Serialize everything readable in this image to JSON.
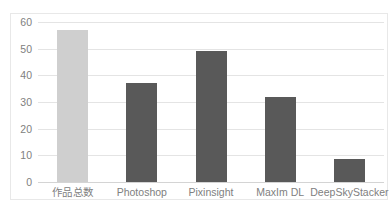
{
  "chart_data": {
    "type": "bar",
    "title": "",
    "subtitle": "",
    "xlabel": "",
    "ylabel": "",
    "categories": [
      "作品总数",
      "Photoshop",
      "Pixinsight",
      "MaxIm DL",
      "DeepSkyStacker"
    ],
    "values": [
      57,
      37,
      49,
      32,
      8.5
    ],
    "ylim": [
      0,
      60
    ],
    "yticks": [
      0,
      10,
      20,
      30,
      40,
      50,
      60
    ],
    "ytick_labels": [
      "0",
      "10",
      "20",
      "30",
      "40",
      "50",
      "60"
    ],
    "grid": true,
    "legend": false,
    "bar_colors": [
      "#cfcfcf",
      "#595959",
      "#595959",
      "#595959",
      "#595959"
    ]
  },
  "style": {
    "background": "#ffffff",
    "frame_border": "#e8e8e8",
    "gridline_color": "#e4e4e4",
    "baseline_color": "#d4d4d4",
    "tick_text_color": "#808080",
    "highlight_bar_color": "#cfcfcf",
    "series_bar_color": "#595959"
  }
}
